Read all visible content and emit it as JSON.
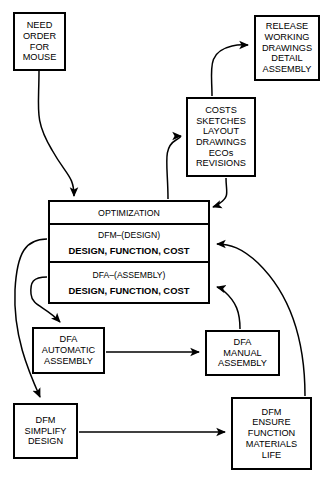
{
  "diagram": {
    "nodes": {
      "need": {
        "name": "need-order-for-mouse",
        "lines": [
          "NEED",
          "ORDER",
          "FOR",
          "MOUSE"
        ]
      },
      "release": {
        "name": "release-working-drawings",
        "lines": [
          "RELEASE",
          "WORKING",
          "DRAWINGS",
          "DETAIL",
          "ASSEMBLY"
        ]
      },
      "costs": {
        "name": "costs-sketches-layout",
        "lines": [
          "COSTS",
          "SKETCHES",
          "LAYOUT",
          "DRAWINGS",
          "ECOs",
          "REVISIONS"
        ]
      },
      "center": {
        "name": "optimization-dfm-dfa",
        "optimization": "OPTIMIZATION",
        "dfm_title": "DFM–(DESIGN)",
        "dfm_sub": "DESIGN, FUNCTION, COST",
        "dfa_title": "DFA–(ASSEMBLY)",
        "dfa_sub": "DESIGN, FUNCTION, COST"
      },
      "dfa_auto": {
        "name": "dfa-automatic-assembly",
        "lines": [
          "DFA",
          "AUTOMATIC",
          "ASSEMBLY"
        ]
      },
      "dfa_manual": {
        "name": "dfa-manual-assembly",
        "lines": [
          "DFA",
          "MANUAL",
          "ASSEMBLY"
        ]
      },
      "dfm_simplify": {
        "name": "dfm-simplify-design",
        "lines": [
          "DFM",
          "SIMPLIFY",
          "DESIGN"
        ]
      },
      "dfm_ensure": {
        "name": "dfm-ensure-function",
        "lines": [
          "DFM",
          "ENSURE",
          "FUNCTION",
          "MATERIALS",
          "LIFE"
        ]
      }
    },
    "edges": [
      {
        "name": "edge-need-to-optimization",
        "from": "need",
        "to": "center",
        "style": "curved-arrow"
      },
      {
        "name": "edge-center-to-costs",
        "from": "center",
        "to": "costs",
        "style": "curved-arrow"
      },
      {
        "name": "edge-costs-to-release",
        "from": "costs",
        "to": "release",
        "style": "curved-arrow"
      },
      {
        "name": "edge-costs-to-center",
        "from": "costs",
        "to": "center",
        "style": "curved-arrow"
      },
      {
        "name": "edge-center-to-dfa-auto",
        "from": "center",
        "to": "dfa_auto",
        "style": "curved-arrow"
      },
      {
        "name": "edge-center-to-dfm-simplify",
        "from": "center",
        "to": "dfm_simplify",
        "style": "curved-arrow"
      },
      {
        "name": "edge-dfa-auto-to-dfa-manual",
        "from": "dfa_auto",
        "to": "dfa_manual",
        "style": "straight-arrow"
      },
      {
        "name": "edge-dfm-simplify-to-dfm-ensure",
        "from": "dfm_simplify",
        "to": "dfm_ensure",
        "style": "straight-arrow"
      },
      {
        "name": "edge-dfa-manual-to-center",
        "from": "dfa_manual",
        "to": "center",
        "style": "curved-arrow"
      },
      {
        "name": "edge-dfm-ensure-to-center",
        "from": "dfm_ensure",
        "to": "center",
        "style": "curved-arrow"
      }
    ],
    "colors": {
      "stroke": "#000000",
      "fill": "#ffffff",
      "text": "#000000"
    }
  }
}
